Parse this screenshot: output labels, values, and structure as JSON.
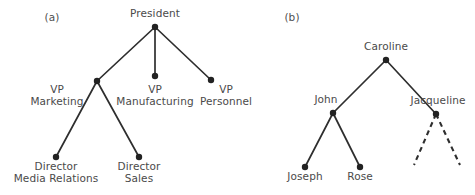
{
  "figure": {
    "width": 475,
    "height": 195,
    "background_color": "#ffffff",
    "node_color": "#222222",
    "edge_color": "#2e2e2e",
    "text_color": "#4a4a4a"
  },
  "panels": [
    {
      "id": "a",
      "label": "(a)",
      "label_x": 52,
      "label_y": 12,
      "caption": "Organization chart tree",
      "nodes": [
        {
          "id": "president",
          "label": "President",
          "x": 155,
          "y": 27,
          "label_x": 155,
          "label_y": 8,
          "label_pos": "above"
        },
        {
          "id": "vp-marketing",
          "label": "VP\nMarketing",
          "x": 97,
          "y": 81,
          "label_x": 57,
          "label_y": 84,
          "label_pos": "left"
        },
        {
          "id": "vp-manufacturing",
          "label": "VP\nManufacturing",
          "x": 155,
          "y": 76,
          "label_x": 155,
          "label_y": 84,
          "label_pos": "below"
        },
        {
          "id": "vp-personnel",
          "label": "VP\nPersonnel",
          "x": 211,
          "y": 80,
          "label_x": 226,
          "label_y": 84,
          "label_pos": "below"
        },
        {
          "id": "dir-media",
          "label": "Director\nMedia Relations",
          "x": 56,
          "y": 157,
          "label_x": 56,
          "label_y": 161,
          "label_pos": "below"
        },
        {
          "id": "dir-sales",
          "label": "Director\nSales",
          "x": 139,
          "y": 157,
          "label_x": 139,
          "label_y": 161,
          "label_pos": "below"
        }
      ],
      "edges": [
        {
          "from": "president",
          "to": "vp-marketing",
          "style": "solid"
        },
        {
          "from": "president",
          "to": "vp-manufacturing",
          "style": "solid"
        },
        {
          "from": "president",
          "to": "vp-personnel",
          "style": "solid"
        },
        {
          "from": "vp-marketing",
          "to": "dir-media",
          "style": "solid"
        },
        {
          "from": "vp-marketing",
          "to": "dir-sales",
          "style": "solid"
        }
      ],
      "dangling_edges": []
    },
    {
      "id": "b",
      "label": "(b)",
      "label_x": 292,
      "label_y": 12,
      "caption": "Family tree",
      "nodes": [
        {
          "id": "caroline",
          "label": "Caroline",
          "x": 386,
          "y": 60,
          "label_x": 386,
          "label_y": 41,
          "label_pos": "above"
        },
        {
          "id": "john",
          "label": "John",
          "x": 333,
          "y": 113,
          "label_x": 326,
          "label_y": 94,
          "label_pos": "above-left"
        },
        {
          "id": "jacqueline",
          "label": "Jacqueline",
          "x": 436,
          "y": 114,
          "label_x": 438,
          "label_y": 95,
          "label_pos": "above"
        },
        {
          "id": "joseph",
          "label": "Joseph",
          "x": 305,
          "y": 167,
          "label_x": 305,
          "label_y": 171,
          "label_pos": "below"
        },
        {
          "id": "rose",
          "label": "Rose",
          "x": 360,
          "y": 167,
          "label_x": 360,
          "label_y": 171,
          "label_pos": "below"
        }
      ],
      "edges": [
        {
          "from": "caroline",
          "to": "john",
          "style": "solid"
        },
        {
          "from": "caroline",
          "to": "jacqueline",
          "style": "solid"
        },
        {
          "from": "john",
          "to": "joseph",
          "style": "solid"
        },
        {
          "from": "john",
          "to": "rose",
          "style": "solid"
        }
      ],
      "dangling_edges": [
        {
          "from": "jacqueline",
          "to_x": 414,
          "to_y": 165,
          "style": "dashed"
        },
        {
          "from": "jacqueline",
          "to_x": 460,
          "to_y": 165,
          "style": "dashed"
        }
      ]
    }
  ]
}
